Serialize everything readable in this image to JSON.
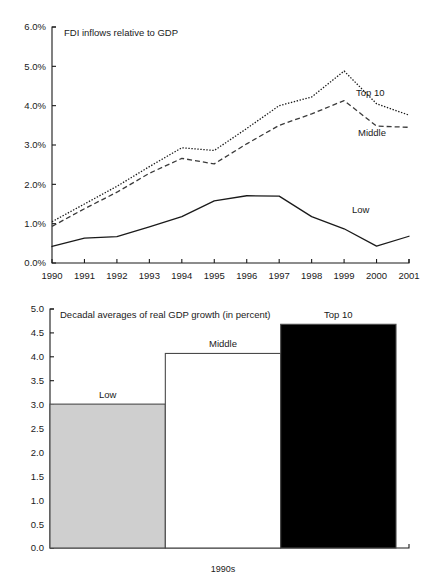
{
  "figure": {
    "background": "#ffffff",
    "ink": "#1a1a1a"
  },
  "chart_data": [
    {
      "type": "line",
      "title": "FDI inflows relative to GDP",
      "xlabel": "",
      "ylabel": "",
      "ylim": [
        0,
        6
      ],
      "yticks": [
        0,
        1,
        2,
        3,
        4,
        5,
        6
      ],
      "ytick_labels": [
        "0.0%",
        "1.0%",
        "2.0%",
        "3.0%",
        "4.0%",
        "5.0%",
        "6.0%"
      ],
      "grid": false,
      "legend_position": "inline-right-end-of-line",
      "categories": [
        "1990",
        "1991",
        "1992",
        "1993",
        "1994",
        "1995",
        "1996",
        "1997",
        "1998",
        "1999",
        "2000",
        "2001"
      ],
      "series": [
        {
          "name": "Top 10",
          "style": "dotted",
          "color": "#1a1a1a",
          "values": [
            1.05,
            1.5,
            1.95,
            2.45,
            2.93,
            2.86,
            3.42,
            4.0,
            4.22,
            4.88,
            4.05,
            3.76
          ]
        },
        {
          "name": "Middle",
          "style": "dashed",
          "color": "#3a3a3a",
          "values": [
            0.93,
            1.38,
            1.8,
            2.28,
            2.66,
            2.52,
            3.03,
            3.5,
            3.79,
            4.13,
            3.48,
            3.45
          ]
        },
        {
          "name": "Low",
          "style": "solid",
          "color": "#1a1a1a",
          "values": [
            0.42,
            0.63,
            0.67,
            0.92,
            1.18,
            1.58,
            1.71,
            1.7,
            1.18,
            0.87,
            0.43,
            0.68
          ]
        }
      ]
    },
    {
      "type": "bar",
      "title": "Decadal averages of real GDP growth (in percent)",
      "xlabel": "1990s",
      "ylabel": "",
      "ylim": [
        0,
        5
      ],
      "yticks": [
        0,
        0.5,
        1,
        1.5,
        2,
        2.5,
        3,
        3.5,
        4,
        4.5,
        5
      ],
      "ytick_labels": [
        "0.0",
        "0.5",
        "1.0",
        "1.5",
        "2.0",
        "2.5",
        "3.0",
        "3.5",
        "4.0",
        "4.5",
        "5.0"
      ],
      "grid": false,
      "categories": [
        "Low",
        "Middle",
        "Top 10"
      ],
      "values": [
        3.01,
        4.07,
        4.68
      ],
      "bar_fills": [
        "#cfcfcf",
        "#ffffff",
        "#000000"
      ],
      "bar_edge": "#4a4a4a"
    }
  ]
}
